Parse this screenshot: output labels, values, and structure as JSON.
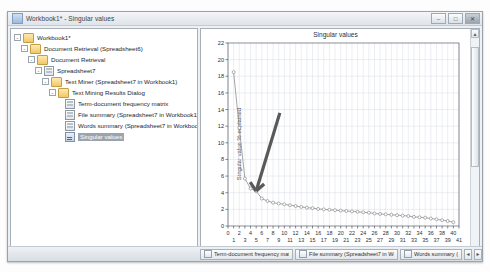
{
  "window": {
    "title": "Workbook1* - Singular values",
    "icon": "workbook-icon",
    "minimize_label": "–",
    "maximize_label": "□",
    "close_label": "✕"
  },
  "tree": {
    "items": [
      {
        "label": "Workbook1*",
        "depth": 0,
        "icon": "folder-icon",
        "expander": "-",
        "selected": false
      },
      {
        "label": "Document Retrieval (Spreadsheet6)",
        "depth": 1,
        "icon": "folder-icon",
        "expander": "-",
        "selected": false
      },
      {
        "label": "Document Retrieval",
        "depth": 2,
        "icon": "folder-icon",
        "expander": "-",
        "selected": false
      },
      {
        "label": "Spreadsheet7",
        "depth": 3,
        "icon": "sheet-icon",
        "expander": "-",
        "selected": false
      },
      {
        "label": "Text Miner (Spreadsheet7 in Workbook1)",
        "depth": 4,
        "icon": "folder-icon",
        "expander": "-",
        "selected": false
      },
      {
        "label": "Text Mining Results Dialog",
        "depth": 5,
        "icon": "folder-icon",
        "expander": "-",
        "selected": false
      },
      {
        "label": "Term-document frequency matrix",
        "depth": 6,
        "icon": "sheet-icon",
        "expander": "",
        "selected": false
      },
      {
        "label": "File summary (Spreadsheet7 in Workbook1)",
        "depth": 6,
        "icon": "sheet-icon",
        "expander": "",
        "selected": false
      },
      {
        "label": "Words summary (Spreadsheet7 in Workbook1)",
        "depth": 6,
        "icon": "sheet-icon",
        "expander": "",
        "selected": false
      },
      {
        "label": "Singular values",
        "depth": 6,
        "icon": "graph-icon",
        "expander": "",
        "selected": true
      }
    ],
    "hscroll": {
      "left_arrow": "◄",
      "right_arrow": "►"
    }
  },
  "chart_data": {
    "type": "line",
    "title": "Singular values",
    "xlabel": "Concept",
    "ylabel": "Singular value % explained",
    "xlim": [
      0,
      41
    ],
    "ylim": [
      0,
      22
    ],
    "ytick_step": 2,
    "grid": true,
    "legend": "none",
    "marker": "open-circle",
    "line_color": "#808080",
    "x": [
      1,
      2,
      3,
      4,
      5,
      6,
      7,
      8,
      9,
      10,
      11,
      12,
      13,
      14,
      15,
      16,
      17,
      18,
      19,
      20,
      21,
      22,
      23,
      24,
      25,
      26,
      27,
      28,
      29,
      30,
      31,
      32,
      33,
      34,
      35,
      36,
      37,
      38,
      39,
      40
    ],
    "values": [
      18.5,
      11.8,
      5.7,
      4.5,
      4.2,
      3.3,
      3.0,
      2.8,
      2.7,
      2.6,
      2.5,
      2.4,
      2.3,
      2.2,
      2.15,
      2.05,
      2.0,
      1.95,
      1.9,
      1.85,
      1.8,
      1.75,
      1.7,
      1.65,
      1.6,
      1.5,
      1.45,
      1.4,
      1.35,
      1.3,
      1.25,
      1.2,
      1.1,
      1.05,
      1.0,
      0.9,
      0.8,
      0.7,
      0.6,
      0.45
    ],
    "xticks_even": [
      0,
      2,
      4,
      6,
      8,
      10,
      12,
      14,
      16,
      18,
      20,
      22,
      24,
      26,
      28,
      30,
      32,
      34,
      36,
      38,
      40
    ],
    "xticks_odd": [
      1,
      3,
      5,
      7,
      9,
      11,
      13,
      15,
      17,
      19,
      21,
      23,
      25,
      27,
      29,
      31,
      33,
      35,
      37,
      39,
      41
    ],
    "yticks": [
      0,
      2,
      4,
      6,
      8,
      10,
      12,
      14,
      16,
      18,
      20,
      22
    ],
    "annotation": {
      "type": "arrow",
      "color": "#595959",
      "points_at_concept": 5,
      "points_at_value": 4.2
    }
  },
  "chart_scroll": {
    "up_arrow": "▲",
    "down_arrow": "▼"
  },
  "taskbar": {
    "buttons": [
      {
        "label": "Term-document frequency matrix",
        "icon": "sheet-icon",
        "width": 93
      },
      {
        "label": "File summary (Spreadsheet7 in Workbook1)",
        "icon": "sheet-icon",
        "width": 103
      },
      {
        "label": "Words summary (Spr",
        "icon": "sheet-icon",
        "width": 62
      }
    ],
    "nav_prev": "◄",
    "nav_next": "►"
  }
}
